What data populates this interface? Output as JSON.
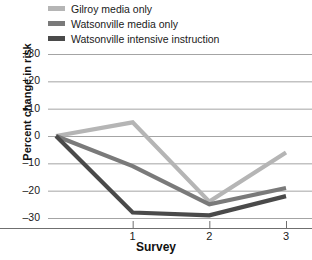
{
  "chart_data": {
    "type": "line",
    "title": "",
    "xlabel": "Survey",
    "ylabel": "Percent change in risk",
    "x": [
      0,
      1,
      2,
      3
    ],
    "xlim": [
      0,
      3.25
    ],
    "ylim": [
      -35,
      30
    ],
    "xticks": [
      1,
      2,
      3
    ],
    "xtick_labels": [
      "1",
      "2",
      "3"
    ],
    "yticks": [
      30,
      20,
      10,
      0,
      -10,
      -20,
      -30
    ],
    "ytick_labels": [
      "+30",
      "+20",
      "+10",
      "0",
      "–10",
      "–20",
      "–30"
    ],
    "grid": true,
    "grid_axis": "y",
    "legend_position": "top-left",
    "series": [
      {
        "name": "Gilroy media only",
        "color": "#b5b5b5",
        "values": [
          0,
          5,
          -24,
          -6
        ]
      },
      {
        "name": "Watsonville media only",
        "color": "#7a7a7a",
        "values": [
          0,
          -11,
          -25,
          -19
        ]
      },
      {
        "name": "Watsonville intensive instruction",
        "color": "#4a4a4a",
        "values": [
          0,
          -28,
          -29,
          -22
        ]
      }
    ]
  },
  "legend": {
    "items": [
      {
        "label": "Gilroy media only",
        "swatch": "#b5b5b5"
      },
      {
        "label": "Watsonville media only",
        "swatch": "#7a7a7a"
      },
      {
        "label": "Watsonville intensive instruction",
        "swatch": "#4a4a4a"
      }
    ]
  },
  "axes": {
    "y_title": "Percent change in risk",
    "x_title": "Survey",
    "y_labels": [
      "+30",
      "+20",
      "+10",
      "0",
      "–10",
      "–20",
      "–30"
    ],
    "x_labels": [
      "1",
      "2",
      "3"
    ]
  },
  "colors": {
    "grid": "#9a9a9a",
    "axis": "#6f6f6f",
    "text": "#1a1a1a"
  }
}
